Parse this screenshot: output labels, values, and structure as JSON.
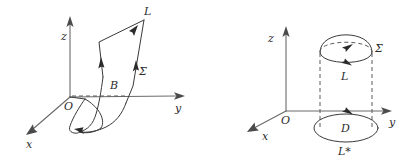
{
  "figure": {
    "background_color": "#ffffff",
    "ink_color": "#3a3a3a",
    "axis_color": "#6a6a6a",
    "width": 408,
    "height": 160
  },
  "left_diagram": {
    "name": "twisted-ribbon-surface",
    "description": "Coordinate frame with a twisted ribbon surface bounded by an oriented curve",
    "axes": {
      "x_label": "x",
      "y_label": "y",
      "z_label": "z",
      "origin_label": "O"
    },
    "labels": {
      "curve": "L",
      "surface": "Σ",
      "point": "B"
    }
  },
  "right_diagram": {
    "name": "cylinder-cap-and-disk",
    "description": "Coordinate frame with a hemispherical cap over a circle and a lower disk",
    "axes": {
      "x_label": "x",
      "y_label": "y",
      "z_label": "z",
      "origin_label": "O"
    },
    "labels": {
      "surface": "Σ",
      "upper_curve": "L",
      "disk": "D",
      "lower_curve": "L*"
    }
  }
}
